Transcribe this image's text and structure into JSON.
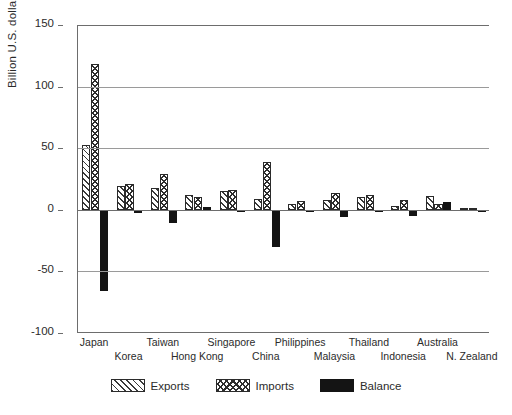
{
  "chart_data": {
    "type": "bar",
    "title": "",
    "subtitle": "",
    "xlabel": "",
    "ylabel": "Billion U.S. dollars",
    "ylim": [
      -100,
      150
    ],
    "yticks": [
      150,
      100,
      50,
      0,
      -50,
      -100
    ],
    "ytick_labels": [
      "150",
      "100",
      "50",
      "0",
      "-50",
      "-100"
    ],
    "grid": true,
    "grid_axis": "y",
    "legend_position": "bottom",
    "categories": [
      "Japan",
      "Korea",
      "Taiwan",
      "Hong Kong",
      "Singapore",
      "China",
      "Philippines",
      "Malaysia",
      "Thailand",
      "Indonesia",
      "Australia",
      "N. Zealand"
    ],
    "series": [
      {
        "name": "Exports",
        "pattern": "diagonal-hatch",
        "values": [
          53,
          19,
          18,
          12,
          15,
          9,
          5,
          8,
          10,
          3,
          11,
          1.5
        ]
      },
      {
        "name": "Imports",
        "pattern": "cross-hatch",
        "values": [
          118,
          21,
          29,
          10,
          16,
          39,
          7,
          14,
          12,
          8,
          5,
          1.5
        ]
      },
      {
        "name": "Balance",
        "pattern": "solid-black",
        "values": [
          -66,
          -3,
          -11,
          2,
          -2,
          -30,
          -1,
          -6,
          -2,
          -5,
          6,
          0
        ]
      }
    ]
  },
  "axis": {
    "y_label": "Billion U.S. dollars",
    "y_ticks": [
      "150",
      "100",
      "50",
      "0",
      "-50",
      "-100"
    ]
  },
  "legend": {
    "items": [
      {
        "label": "Exports",
        "swatch": "diagonal-hatch-swatch"
      },
      {
        "label": "Imports",
        "swatch": "cross-hatch-swatch"
      },
      {
        "label": "Balance",
        "swatch": "solid-black-swatch"
      }
    ]
  },
  "x_axis_labels": [
    "Japan",
    "Korea",
    "Taiwan",
    "Hong Kong",
    "Singapore",
    "China",
    "Philippines",
    "Malaysia",
    "Thailand",
    "Indonesia",
    "Australia",
    "N. Zealand"
  ]
}
